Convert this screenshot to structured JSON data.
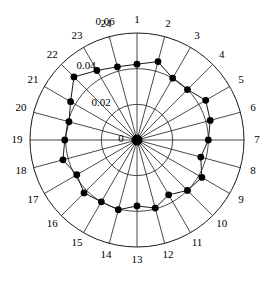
{
  "chart_data": {
    "type": "line",
    "subtype": "polar-radar",
    "title": "",
    "xlabel": "",
    "ylabel": "",
    "grid": true,
    "legend": null,
    "closed": true,
    "angular_axis": {
      "label": "",
      "categories": [
        "1",
        "2",
        "3",
        "4",
        "5",
        "6",
        "7",
        "8",
        "9",
        "10",
        "11",
        "12",
        "13",
        "14",
        "15",
        "16",
        "17",
        "18",
        "19",
        "20",
        "21",
        "22",
        "23",
        "24"
      ],
      "start_angle_deg": 90,
      "direction": "clockwise",
      "step_deg": 15
    },
    "radial_axis": {
      "label": "",
      "ticks": [
        0,
        0.02,
        0.04,
        0.06
      ],
      "tick_labels": [
        "0",
        "0.02",
        "0.04",
        "0.06"
      ],
      "rlim": [
        0,
        0.06
      ]
    },
    "categories": [
      "1",
      "2",
      "3",
      "4",
      "5",
      "6",
      "7",
      "8",
      "9",
      "10",
      "11",
      "12",
      "13",
      "14",
      "15",
      "16",
      "17",
      "18",
      "19",
      "20",
      "21",
      "22",
      "23",
      "24"
    ],
    "values": [
      0.0425,
      0.0455,
      0.04,
      0.04,
      0.0445,
      0.0425,
      0.04,
      0.037,
      0.042,
      0.04,
      0.0355,
      0.0395,
      0.037,
      0.0405,
      0.04,
      0.042,
      0.039,
      0.043,
      0.0405,
      0.0395,
      0.043,
      0.05,
      0.045,
      0.0425
    ],
    "series": [
      {
        "name": "series-1",
        "values": [
          0.0425,
          0.0455,
          0.04,
          0.04,
          0.0445,
          0.0425,
          0.04,
          0.037,
          0.042,
          0.04,
          0.0355,
          0.0395,
          0.037,
          0.0405,
          0.04,
          0.042,
          0.039,
          0.043,
          0.0405,
          0.0395,
          0.043,
          0.05,
          0.045,
          0.0425
        ],
        "marker": "filled-circle",
        "color": "#000000"
      }
    ],
    "center_marker": {
      "present": true,
      "value": 0,
      "label": "0"
    }
  },
  "geometry": {
    "center_x": 137,
    "center_y": 140,
    "outer_radius": 107,
    "label_radius": 120
  },
  "radial_label_positions": [
    {
      "text": "0",
      "x": 121,
      "y": 139
    },
    {
      "text": "0.02",
      "x": 101,
      "y": 103
    },
    {
      "text": "0.04",
      "x": 86,
      "y": 66
    },
    {
      "text": "0.06",
      "x": 105,
      "y": 22
    }
  ]
}
